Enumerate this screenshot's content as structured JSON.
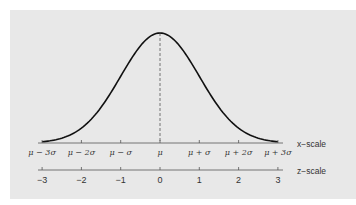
{
  "chart_data": {
    "type": "line",
    "title": "",
    "x_scale": {
      "label": "x−scale",
      "ticks": [
        "μ − 3σ",
        "μ − 2σ",
        "μ − σ",
        "μ",
        "μ + σ",
        "μ + 2σ",
        "μ + 3σ"
      ]
    },
    "z_scale": {
      "label": "z−scale",
      "ticks": [
        "−3",
        "−2",
        "−1",
        "0",
        "1",
        "2",
        "3"
      ],
      "values": [
        -3,
        -2,
        -1,
        0,
        1,
        2,
        3
      ]
    },
    "curve": {
      "distribution": "normal",
      "mean": 0,
      "sd": 1,
      "xlim": [
        -3,
        3
      ]
    },
    "annotations": [
      "dashed vertical line at mean μ (z = 0)"
    ],
    "colors": {
      "background": "#e8e8e8",
      "curve": "#111111",
      "axis": "#555555"
    }
  }
}
